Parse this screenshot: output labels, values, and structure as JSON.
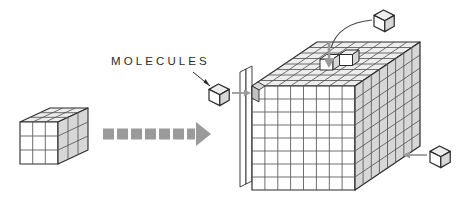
{
  "figure": {
    "background_color": "#ffffff",
    "width": 467,
    "height": 202
  },
  "labels": {
    "molecules": "MOLECULES"
  },
  "colors": {
    "outline": "#2b2b2b",
    "grid_line": "#555555",
    "face_shade": "#d7d7d7",
    "face_shade_dark": "#c2c2c2",
    "face_top": "#ededed",
    "face_front": "#ffffff",
    "arrow_gray": "#9a9a9a",
    "text": "#2b2b2b"
  },
  "objects": {
    "small_block": {
      "name": "small-crystal-block",
      "grid": {
        "cols": 3,
        "rows": 3,
        "depth": 3
      },
      "position": {
        "x": 20,
        "y": 108,
        "width": 68,
        "height": 56
      }
    },
    "large_block": {
      "name": "large-crystal-block",
      "grid": {
        "cols": 8,
        "rows": 8,
        "depth": 8
      },
      "position": {
        "x": 240,
        "y": 40,
        "width": 180,
        "height": 150
      },
      "has_vacancy": true,
      "vacancy_location": "top-face"
    },
    "growth_arrow": {
      "name": "growth-arrow",
      "style": "dashed",
      "color": "#9a9a9a",
      "direction": "right",
      "position": {
        "x": 103,
        "y": 128,
        "width": 103,
        "height": 13
      }
    },
    "free_molecules": [
      {
        "name": "molecule-cube-left",
        "position": {
          "x": 209,
          "y": 80
        },
        "size": 15,
        "arrow_direction": "right",
        "arrow_target": "large-block-left-face"
      },
      {
        "name": "molecule-cube-top",
        "position": {
          "x": 374,
          "y": 10
        },
        "size": 15,
        "arrow_direction": "curve-down-left",
        "arrow_target": "large-block-top-vacancy"
      },
      {
        "name": "molecule-cube-right",
        "position": {
          "x": 430,
          "y": 142
        },
        "size": 15,
        "arrow_direction": "left",
        "arrow_target": "large-block-right-face"
      }
    ],
    "leader_line": {
      "name": "molecules-label-leader",
      "from": {
        "x": 196,
        "y": 74
      },
      "to": {
        "x": 212,
        "y": 86
      }
    }
  }
}
